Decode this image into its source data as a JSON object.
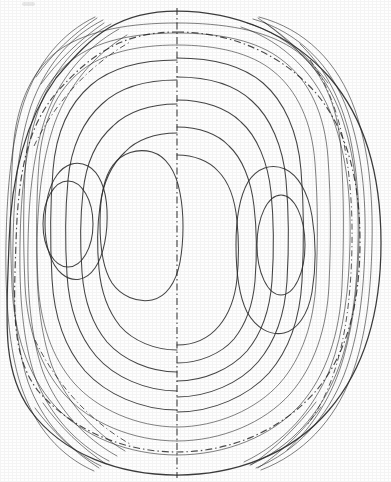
{
  "figure": {
    "title": "Streamline contour plot in a circular domain",
    "background_color": "#fefefe",
    "ink_color": "#2b2b2b",
    "width": 391,
    "height": 482
  },
  "chart_data": {
    "type": "line",
    "subtype": "contour",
    "title": "Streamline contour plot in a circular domain",
    "xlabel": "",
    "ylabel": "",
    "xlim": [
      0,
      391
    ],
    "ylim": [
      0,
      482
    ],
    "grid": false,
    "legend_position": "none",
    "annotations": [],
    "tick_labels": {
      "x": [],
      "y": []
    },
    "domain": {
      "name": "outer-boundary",
      "shape": "ellipse",
      "center": [
        193,
        243
      ],
      "rx": 186,
      "ry": 231,
      "line_style": "solid"
    },
    "reference_circle": {
      "name": "inner-reference-circle",
      "shape": "ellipse",
      "center": [
        190,
        241
      ],
      "rx": 168,
      "ry": 209,
      "line_style": "dash-dot"
    },
    "symmetry_axis": {
      "name": "vertical-centerline",
      "x": 177,
      "y_start": 8,
      "y_end": 478,
      "line_style": "dash-dot"
    },
    "cells": [
      {
        "name": "left-cell",
        "rotation": "counter-clockwise",
        "center": [
          68,
          224
        ],
        "innermost_rx": 25,
        "innermost_ry": 43,
        "contour_count": 9,
        "levels": [
          -0.9,
          -0.8,
          -0.65,
          -0.5,
          -0.35,
          -0.22,
          -0.12,
          -0.05,
          -0.015
        ]
      },
      {
        "name": "right-cell",
        "rotation": "clockwise",
        "center": [
          281,
          245
        ],
        "innermost_rx": 24,
        "innermost_ry": 50,
        "contour_count": 9,
        "levels": [
          0.9,
          0.8,
          0.65,
          0.5,
          0.35,
          0.22,
          0.12,
          0.05,
          0.015
        ]
      }
    ],
    "series": [
      {
        "name": "level -0.90",
        "cell": "left",
        "closed": true,
        "rx": 25,
        "ry": 43
      },
      {
        "name": "level -0.80",
        "cell": "left",
        "closed": true,
        "rx": 43,
        "ry": 72
      },
      {
        "name": "level -0.65",
        "cell": "left",
        "closed": true,
        "rx": 58,
        "ry": 100
      },
      {
        "name": "level -0.50",
        "cell": "left",
        "closed": true,
        "rx": 72,
        "ry": 127
      },
      {
        "name": "level -0.35",
        "cell": "left",
        "closed": true,
        "rx": 85,
        "ry": 153
      },
      {
        "name": "level -0.22",
        "cell": "left",
        "closed": true,
        "rx": 97,
        "ry": 176
      },
      {
        "name": "level -0.12",
        "cell": "left",
        "closed": true,
        "rx": 108,
        "ry": 194
      },
      {
        "name": "level -0.05",
        "cell": "left",
        "closed": true,
        "rx": 118,
        "ry": 208
      },
      {
        "name": "level -0.015",
        "cell": "left",
        "closed": true,
        "rx": 128,
        "ry": 219
      },
      {
        "name": "level +0.90",
        "cell": "right",
        "closed": true,
        "rx": 24,
        "ry": 50
      },
      {
        "name": "level +0.80",
        "cell": "right",
        "closed": true,
        "rx": 42,
        "ry": 80
      },
      {
        "name": "level +0.65",
        "cell": "right",
        "closed": true,
        "rx": 58,
        "ry": 107
      },
      {
        "name": "level +0.50",
        "cell": "right",
        "closed": true,
        "rx": 72,
        "ry": 133
      },
      {
        "name": "level +0.35",
        "cell": "right",
        "closed": true,
        "rx": 84,
        "ry": 157
      },
      {
        "name": "level +0.22",
        "cell": "right",
        "closed": true,
        "rx": 95,
        "ry": 178
      },
      {
        "name": "level +0.12",
        "cell": "right",
        "closed": true,
        "rx": 104,
        "ry": 196
      },
      {
        "name": "level +0.05",
        "cell": "right",
        "closed": true,
        "rx": 112,
        "ry": 210
      },
      {
        "name": "level +0.015",
        "cell": "right",
        "closed": true,
        "rx": 119,
        "ry": 221
      }
    ]
  }
}
